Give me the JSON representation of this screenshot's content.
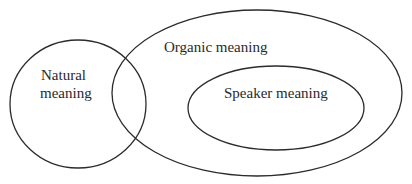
{
  "diagram": {
    "type": "euler",
    "sets": [
      {
        "id": "natural",
        "label_lines": [
          "Natural",
          "meaning"
        ]
      },
      {
        "id": "organic",
        "label": "Organic meaning"
      },
      {
        "id": "speaker",
        "label": "Speaker meaning",
        "subset_of": "organic"
      }
    ],
    "relations": [
      "natural overlaps organic",
      "speaker contained in organic"
    ],
    "stroke_color": "#2b2b2b"
  }
}
